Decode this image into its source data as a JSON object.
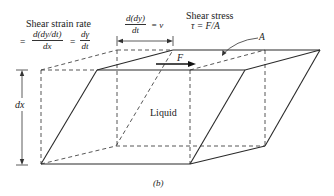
{
  "diagram": {
    "shear_strain_rate": {
      "title": "Shear strain rate",
      "equals_1": "=",
      "frac1_num": "d(dy/dt)",
      "frac1_den": "dx",
      "equals_2": "=",
      "frac2_num": "dγ",
      "frac2_den": "dt"
    },
    "velocity": {
      "frac_num": "d(dy)",
      "frac_den": "dt",
      "rhs": "= v"
    },
    "shear_stress": {
      "title": "Shear stress",
      "formula": "τ = F/A"
    },
    "area_label": "A",
    "force_label": "F",
    "height_label": "dx",
    "fluid_label": "Liquid",
    "caption": "(b)",
    "colors": {
      "line": "#2a2a2a",
      "dashed": "#444444",
      "background": "#ffffff"
    }
  }
}
